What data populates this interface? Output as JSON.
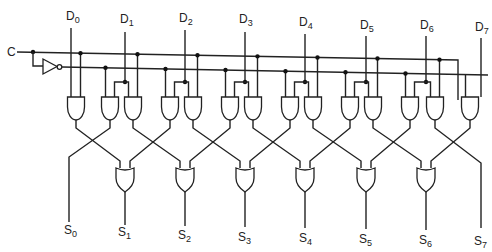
{
  "diagram": {
    "type": "logic-circuit",
    "control_input": {
      "label": "C"
    },
    "inputs": [
      {
        "label": "D",
        "sub": "0"
      },
      {
        "label": "D",
        "sub": "1"
      },
      {
        "label": "D",
        "sub": "2"
      },
      {
        "label": "D",
        "sub": "3"
      },
      {
        "label": "D",
        "sub": "4"
      },
      {
        "label": "D",
        "sub": "5"
      },
      {
        "label": "D",
        "sub": "6"
      },
      {
        "label": "D",
        "sub": "7"
      }
    ],
    "outputs": [
      {
        "label": "S",
        "sub": "0"
      },
      {
        "label": "S",
        "sub": "1"
      },
      {
        "label": "S",
        "sub": "2"
      },
      {
        "label": "S",
        "sub": "3"
      },
      {
        "label": "S",
        "sub": "4"
      },
      {
        "label": "S",
        "sub": "5"
      },
      {
        "label": "S",
        "sub": "6"
      },
      {
        "label": "S",
        "sub": "7"
      }
    ],
    "gates": {
      "inverter": 1,
      "and": 14,
      "or": 6
    },
    "colors": {
      "line": "#222222",
      "background": "#ffffff"
    }
  }
}
